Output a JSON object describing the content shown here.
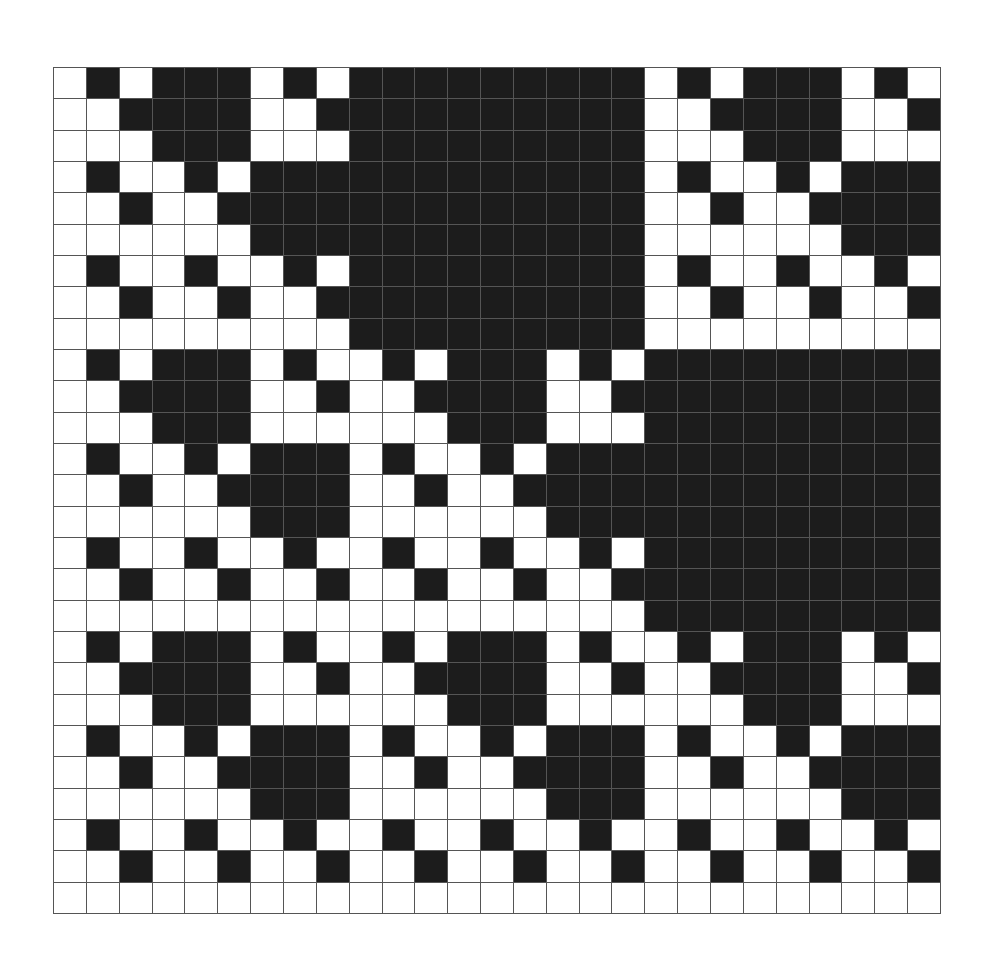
{
  "diagram": {
    "type": "binary-grid-fractal",
    "rows_count": 27,
    "cols_count": 27,
    "colors": {
      "filled": "#1c1c1c",
      "empty": "#ffffff",
      "gridline": "#555555"
    },
    "rows": [
      "010111010111111111010111010",
      "001111001111111111001111001",
      "000111000111111111000111000",
      "010010111111111111010010111",
      "001001111111111111001001111",
      "000000111111111111000000111",
      "010010010111111111010010010",
      "001001001111111111001001001",
      "000000000111111111000000000",
      "010111010010111010111111111",
      "001111001001111001111111111",
      "000111000000111000111111111",
      "010010111010010111111111111",
      "001001111001001111111111111",
      "000000111000000111111111111",
      "010010010010010010111111111",
      "001001001001001001111111111",
      "000000000000000000111111111",
      "010111010010111010010111010",
      "001111001001111001001111001",
      "000111000000111000000111000",
      "010010111010010111010010111",
      "001001111001001111001001111",
      "000000111000000111000000111",
      "010010010010010010010010010",
      "001001001001001001001001001",
      "000000000000000000000000000"
    ]
  }
}
